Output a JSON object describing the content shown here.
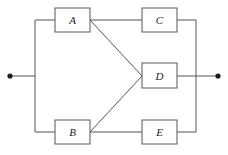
{
  "diagram": {
    "type": "reliability-block-diagram",
    "title": "",
    "canvas": {
      "width": 228,
      "height": 155,
      "background": "#ffffff"
    },
    "colors": {
      "line": "#53565a",
      "block_fill": "#ffffff",
      "terminal": "#1c1c1c",
      "label": "#1c1c1c"
    },
    "blocks": [
      {
        "id": "A",
        "label": "A",
        "x": 55,
        "y": 8,
        "width": 35,
        "height": 24,
        "cx": 72.5,
        "cy": 20
      },
      {
        "id": "C",
        "label": "C",
        "x": 142,
        "y": 8,
        "width": 35,
        "height": 24,
        "cx": 159.5,
        "cy": 20
      },
      {
        "id": "D",
        "label": "D",
        "x": 142,
        "y": 63,
        "width": 35,
        "height": 25,
        "cx": 159.5,
        "cy": 75.5
      },
      {
        "id": "B",
        "label": "B",
        "x": 55,
        "y": 120,
        "width": 35,
        "height": 24,
        "cx": 72.5,
        "cy": 132
      },
      {
        "id": "E",
        "label": "E",
        "x": 142,
        "y": 120,
        "width": 35,
        "height": 24,
        "cx": 159.5,
        "cy": 132
      }
    ],
    "terminals": [
      {
        "id": "input",
        "name": "left-terminal",
        "cx": 10,
        "cy": 76,
        "r": 2.6
      },
      {
        "id": "output",
        "name": "right-terminal",
        "cx": 218,
        "cy": 76,
        "r": 2.6
      }
    ],
    "buses": [
      {
        "id": "left-bus",
        "x": 35,
        "y1": 20,
        "y2": 132
      },
      {
        "id": "right-bus",
        "x": 196,
        "y1": 20,
        "y2": 132
      }
    ],
    "connections": [
      {
        "from": "input",
        "to": "left-bus",
        "path": "M 10 76 L 35 76"
      },
      {
        "from": "left-bus",
        "to": "A",
        "path": "M 35 20 L 55 20"
      },
      {
        "from": "left-bus",
        "to": "B",
        "path": "M 35 132 L 55 132"
      },
      {
        "from": "A",
        "to": "C",
        "path": "M 90 20 L 142 20"
      },
      {
        "from": "A",
        "to": "D",
        "path": "M 90 20 L 142 76"
      },
      {
        "from": "B",
        "to": "E",
        "path": "M 90 132 L 142 132"
      },
      {
        "from": "B",
        "to": "D",
        "path": "M 90 132 L 142 76"
      },
      {
        "from": "C",
        "to": "right-bus",
        "path": "M 177 20 L 196 20"
      },
      {
        "from": "D",
        "to": "output",
        "path": "M 177 76 L 218 76"
      },
      {
        "from": "E",
        "to": "right-bus",
        "path": "M 177 132 L 196 132"
      }
    ]
  }
}
